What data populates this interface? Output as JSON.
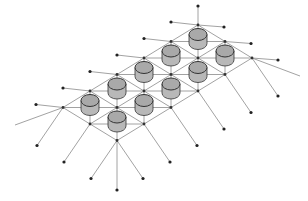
{
  "diagram": {
    "apex": [
      198,
      25
    ],
    "step_a": [
      -27,
      16.5
    ],
    "step_b": [
      27,
      16.5
    ],
    "grid_i": 5,
    "grid_j": 2,
    "cylinder_count": 10,
    "colors": {
      "background": "#ffffff",
      "line": "#8a8a8a",
      "node": "#333333",
      "cylinder_fill": "#a9a9a9",
      "cylinder_side": "#b8b8b8",
      "cylinder_stroke": "#333333",
      "anchor": "#222222"
    }
  }
}
